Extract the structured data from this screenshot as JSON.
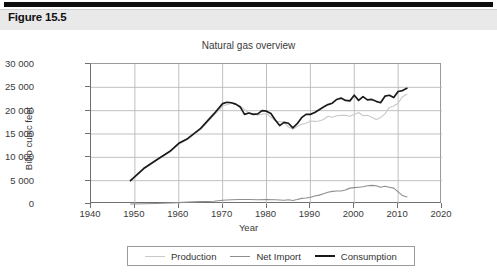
{
  "banner": {
    "figure_label": "Figure 15.5"
  },
  "chart_data": {
    "type": "line",
    "title": "Natural gas overview",
    "xlabel": "Year",
    "ylabel": "Billio cubic feet",
    "xlim": [
      1940,
      2020
    ],
    "ylim": [
      0,
      30000
    ],
    "xticks": [
      1940,
      1950,
      1960,
      1970,
      1980,
      1990,
      2000,
      2010,
      2020
    ],
    "xtick_labels": [
      "1940",
      "1950",
      "1960",
      "1970",
      "1980",
      "1990",
      "2000",
      "2010",
      "2020"
    ],
    "yticks": [
      0,
      5000,
      10000,
      15000,
      20000,
      25000,
      30000
    ],
    "ytick_labels": [
      "0",
      "5 000",
      "10 000",
      "15 000",
      "20 000",
      "25 000",
      "30 000"
    ],
    "grid": true,
    "legend_position": "bottom",
    "colors": {
      "production": "#c9c9c9",
      "net_import": "#8e8e8e",
      "consumption": "#1a1a1a",
      "grid": "#b9b9b9",
      "axis": "#6f6f6f"
    },
    "series": [
      {
        "name": "Production",
        "color": "#c9c9c9",
        "x": [
          1949,
          1952,
          1955,
          1958,
          1960,
          1962,
          1965,
          1968,
          1970,
          1972,
          1974,
          1976,
          1978,
          1980,
          1982,
          1984,
          1985,
          1986,
          1987,
          1988,
          1989,
          1990,
          1991,
          1992,
          1993,
          1994,
          1995,
          1996,
          1997,
          1998,
          1999,
          2000,
          2001,
          2002,
          2003,
          2004,
          2005,
          2006,
          2007,
          2008,
          2009,
          2010,
          2011,
          2012
        ],
        "values": [
          5000,
          7500,
          9400,
          11200,
          12800,
          13800,
          16000,
          19000,
          21000,
          21600,
          21000,
          19500,
          19100,
          19400,
          17800,
          17500,
          16500,
          16000,
          16600,
          17100,
          17300,
          17800,
          17700,
          17800,
          18100,
          18800,
          18600,
          18900,
          19000,
          19000,
          18800,
          19200,
          19600,
          18900,
          19000,
          18600,
          18100,
          18500,
          19300,
          20700,
          21000,
          21600,
          23000,
          23500
        ]
      },
      {
        "name": "Net Import",
        "color": "#8e8e8e",
        "x": [
          1949,
          1952,
          1955,
          1958,
          1960,
          1962,
          1965,
          1968,
          1970,
          1972,
          1974,
          1976,
          1978,
          1980,
          1982,
          1984,
          1985,
          1986,
          1987,
          1988,
          1989,
          1990,
          1991,
          1992,
          1993,
          1994,
          1995,
          1996,
          1997,
          1998,
          1999,
          2000,
          2001,
          2002,
          2003,
          2004,
          2005,
          2006,
          2007,
          2008,
          2009,
          2010,
          2011,
          2012
        ],
        "values": [
          0,
          50,
          100,
          200,
          300,
          400,
          500,
          600,
          800,
          900,
          950,
          950,
          900,
          950,
          900,
          800,
          900,
          750,
          950,
          1200,
          1300,
          1450,
          1700,
          1900,
          2200,
          2500,
          2700,
          2800,
          2800,
          3000,
          3400,
          3500,
          3600,
          3700,
          3900,
          4000,
          3900,
          3600,
          3800,
          3600,
          3400,
          2600,
          1800,
          1500
        ]
      },
      {
        "name": "Consumption",
        "color": "#1a1a1a",
        "x": [
          1949,
          1952,
          1955,
          1958,
          1960,
          1962,
          1965,
          1968,
          1970,
          1971,
          1972,
          1973,
          1974,
          1975,
          1976,
          1977,
          1978,
          1979,
          1980,
          1981,
          1982,
          1983,
          1984,
          1985,
          1986,
          1987,
          1988,
          1989,
          1990,
          1991,
          1992,
          1993,
          1994,
          1995,
          1996,
          1997,
          1998,
          1999,
          2000,
          2001,
          2002,
          2003,
          2004,
          2005,
          2006,
          2007,
          2008,
          2009,
          2010,
          2011,
          2012
        ],
        "values": [
          5000,
          7600,
          9500,
          11300,
          13000,
          14000,
          16200,
          19300,
          21500,
          21800,
          21700,
          21400,
          20800,
          19200,
          19500,
          19200,
          19300,
          20000,
          19900,
          19400,
          18000,
          16800,
          17500,
          17300,
          16300,
          17200,
          18500,
          19200,
          19200,
          19600,
          20200,
          20800,
          21300,
          21600,
          22400,
          22700,
          22200,
          22100,
          23300,
          22200,
          23000,
          22300,
          22400,
          22000,
          21700,
          23100,
          23300,
          22800,
          24100,
          24300,
          24800
        ]
      }
    ]
  },
  "legend": {
    "items": [
      {
        "label": "Production",
        "color": "#c9c9c9"
      },
      {
        "label": "Net Import",
        "color": "#8e8e8e"
      },
      {
        "label": "Consumption",
        "color": "#1a1a1a"
      }
    ]
  }
}
